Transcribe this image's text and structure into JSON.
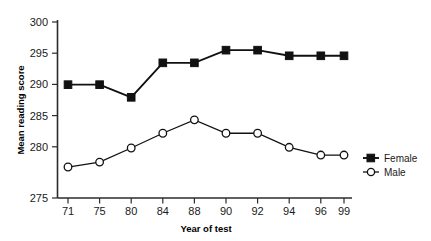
{
  "chart_data": {
    "type": "line",
    "title": "",
    "xlabel": "Year of test",
    "ylabel": "Mean reading score",
    "categories": [
      "71",
      "75",
      "80",
      "84",
      "88",
      "90",
      "92",
      "94",
      "96",
      "99"
    ],
    "ylim": [
      275,
      300
    ],
    "yticks": [
      275,
      280,
      285,
      290,
      295,
      300
    ],
    "grid": false,
    "legend_position": "right",
    "series": [
      {
        "name": "Female",
        "marker": "filled-square",
        "color": "#111111",
        "values": [
          291.1,
          291.1,
          289.3,
          294.2,
          294.2,
          296.0,
          296.0,
          295.2,
          295.2,
          295.2
        ]
      },
      {
        "name": "Male",
        "marker": "open-circle",
        "color": "#111111",
        "values": [
          279.4,
          280.1,
          282.1,
          284.2,
          286.1,
          284.2,
          284.2,
          282.2,
          281.1,
          281.1
        ]
      }
    ]
  },
  "axes": {
    "y_title": "Mean reading score",
    "x_title": "Year of test",
    "y_tick_labels": [
      "300",
      "295",
      "290",
      "285",
      "280",
      "275"
    ],
    "x_tick_labels": [
      "71",
      "75",
      "80",
      "84",
      "88",
      "90",
      "92",
      "94",
      "96",
      "99"
    ]
  },
  "legend": {
    "entries": [
      {
        "label": "Female",
        "marker": "filled-square"
      },
      {
        "label": "Male",
        "marker": "open-circle"
      }
    ]
  }
}
